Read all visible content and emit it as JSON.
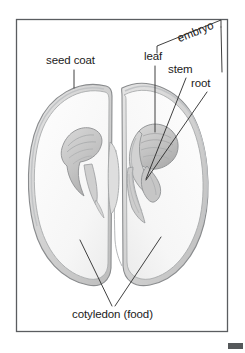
{
  "figure": {
    "frame": {
      "border_color": "#5a5d60",
      "background_color": "#ffffff"
    },
    "corner_mark_color": "#55585a"
  },
  "labels": {
    "seed_coat": "seed coat",
    "embryo": "embryo",
    "leaf": "leaf",
    "stem": "stem",
    "root": "root",
    "cotyledon": "cotyledon (food)"
  },
  "colors": {
    "ink": "#1b1b1b",
    "leader_line": "#2a2a2a",
    "seed_outline": "#8b8d8f",
    "seed_fill": "#fbfbfb",
    "coat_fill": "#dcdcdc",
    "embryo_fill": "#c9c9c9",
    "shading": "#b4b6b8"
  },
  "annotations": [
    {
      "name": "seed-coat",
      "text": "seed coat",
      "leader": "vertical line down to seed coat of left cotyledon"
    },
    {
      "name": "embryo",
      "text": "embryo",
      "leader": "angled bracket grouping leaf, stem and root"
    },
    {
      "name": "leaf",
      "text": "leaf",
      "leader": "vertical line down to embryonic leaf"
    },
    {
      "name": "stem",
      "text": "stem",
      "leader": "diagonal line down-left to embryonic stem"
    },
    {
      "name": "root",
      "text": "root",
      "leader": "diagonal line down-left to embryonic root"
    },
    {
      "name": "cotyledon",
      "text": "cotyledon (food)",
      "leader": "V-shaped pair of lines to both cotyledons"
    }
  ]
}
